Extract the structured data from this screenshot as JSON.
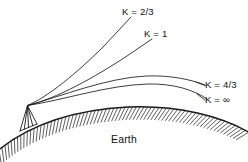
{
  "figure": {
    "background_color": "#ffffff",
    "line_color": "#1a1a1a",
    "width": 248,
    "height": 162
  },
  "labels": {
    "k_two_thirds": "K = 2/3",
    "k_one": "K = 1",
    "k_four_thirds": "K = 4/3",
    "k_infinity": "K = ∞",
    "earth": "Earth"
  },
  "rays": [
    {
      "id": "ray-k-2-3",
      "label": "K = 2/3",
      "k_value": "2/3",
      "path": "M27.5,105.5 C48,97 78,72 104,46 L131,17",
      "label_x": 122,
      "label_y": 14.5,
      "leader": ""
    },
    {
      "id": "ray-k-1",
      "label": "K = 1",
      "k_value": "1",
      "path": "M27.5,105.5 C56,99 95,77 127,56 L152,39",
      "label_x": 144,
      "label_y": 36.5,
      "leader": ""
    },
    {
      "id": "ray-k-4-3",
      "label": "K = 4/3",
      "k_value": "4/3",
      "path": "M27.5,105.5 C62,96 106,78 146,76 C172,75 192,80 205,85",
      "label_x": 205,
      "label_y": 87.5,
      "leader": "M196,82 L205,85.5"
    },
    {
      "id": "ray-k-infinity",
      "label": "K = ∞",
      "k_value": "∞",
      "path": "M27.5,105.5 C64,100 108,85 148,84 C174,83.5 194,90 207,99",
      "label_x": 205,
      "label_y": 102.5,
      "leader": "M197,94 L205,100"
    }
  ],
  "earth": {
    "label": "Earth",
    "label_x": 124,
    "label_y": 143,
    "surface_path": "M-4,152 C26,127 70,110 128,107 C178,105 222,116 252,134",
    "hatch_count": 72,
    "hatch_length": 13
  },
  "tower": {
    "name": "antenna-tower",
    "apex_x": 27.5,
    "apex_y": 105.5,
    "base_left_x": 20,
    "base_left_y": 131,
    "base_right_x": 37,
    "base_right_y": 124,
    "leg_count": 5
  }
}
